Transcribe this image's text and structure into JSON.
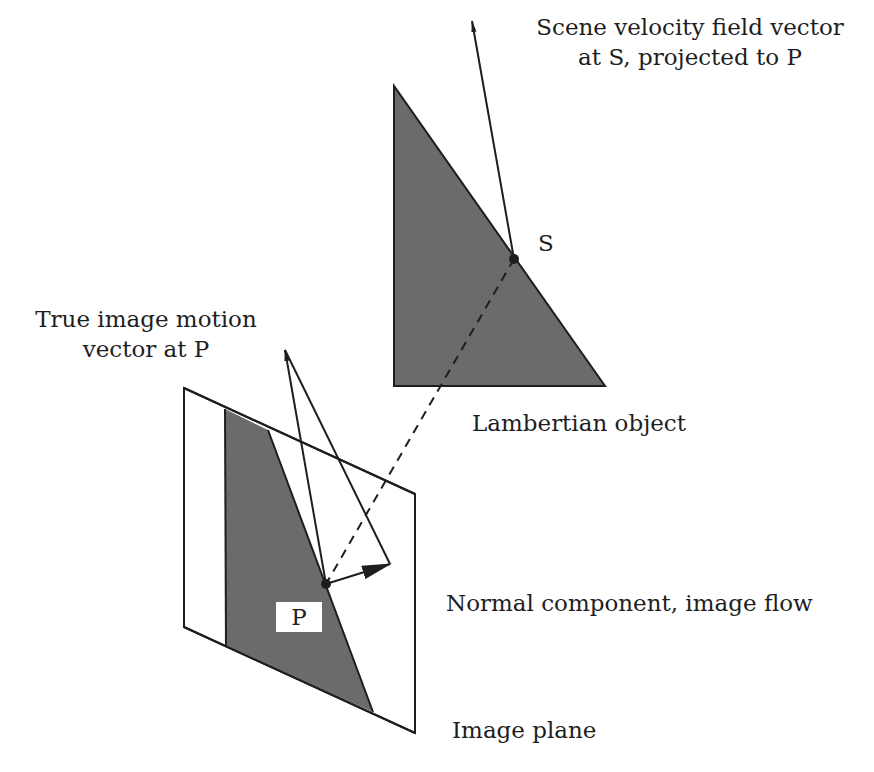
{
  "figure": {
    "type": "optical-flow-geometry-diagram",
    "background": "#ffffff",
    "colors": {
      "ink": "#1e1e1e",
      "shaded_region": "#6b6b6b",
      "plane_fill": "#ffffff"
    }
  },
  "labels": {
    "scene_vector": {
      "line1": "Scene velocity field vector",
      "line2": "at S, projected to P"
    },
    "true_motion": {
      "line1": "True image motion",
      "line2": "vector at P"
    },
    "lambertian_object": "Lambertian object",
    "normal_component": "Normal component, image flow",
    "image_plane": "Image plane",
    "point_s": "S",
    "point_p": "P"
  },
  "geometry": {
    "object_triangle": [
      [
        394,
        86
      ],
      [
        394,
        386
      ],
      [
        605,
        386
      ]
    ],
    "point_s": [
      514,
      259
    ],
    "scene_vector": {
      "from": [
        514,
        259
      ],
      "to": [
        472,
        21
      ]
    },
    "image_plane": [
      [
        184,
        388
      ],
      [
        415,
        494
      ],
      [
        415,
        733
      ],
      [
        184,
        627
      ]
    ],
    "image_region": [
      [
        225,
        409
      ],
      [
        268,
        430
      ],
      [
        373,
        712
      ],
      [
        226,
        647
      ]
    ],
    "point_p": [
      326,
      584
    ],
    "true_motion_vector": {
      "from": [
        326,
        584
      ],
      "to": [
        285,
        350
      ]
    },
    "parallelogram_edge": {
      "from": [
        390,
        564
      ],
      "to": [
        285,
        350
      ]
    },
    "normal_flow_vector": {
      "from": [
        326,
        584
      ],
      "to": [
        390,
        564
      ]
    },
    "projection_line": {
      "from": [
        514,
        259
      ],
      "to": [
        326,
        584
      ],
      "style": "dashed"
    }
  }
}
